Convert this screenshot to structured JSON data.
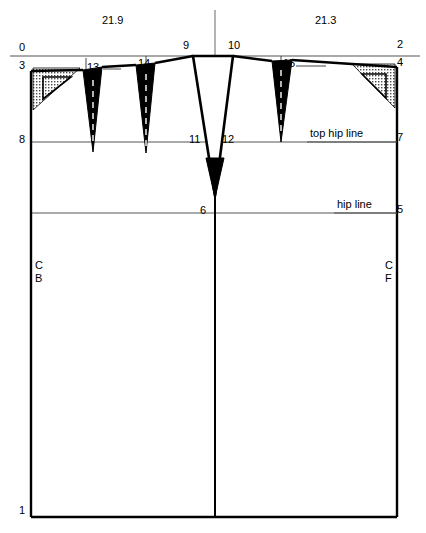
{
  "diagram": {
    "type": "pattern-drafting-diagram",
    "colors": {
      "ink": "#000000",
      "construction_line": "#555555",
      "dart_fill": "#000000",
      "stipple_fill": "#b8b8b8",
      "background": "#ffffff"
    },
    "dimension_labels": [
      {
        "id": "dim-left",
        "text": "21.9",
        "x": 117,
        "y": 21
      },
      {
        "id": "dim-right",
        "text": "21.3",
        "x": 330,
        "y": 21
      }
    ],
    "named_lines": [
      {
        "id": "top-hip-line",
        "text": "top hip line",
        "x": 357,
        "y": 134
      },
      {
        "id": "hip-line",
        "text": "hip line",
        "x": 364,
        "y": 205
      }
    ],
    "edge_labels": [
      {
        "id": "cb",
        "line1": "C",
        "line2": "B",
        "x": 38,
        "y": 263
      },
      {
        "id": "cf",
        "line1": "C",
        "line2": "F",
        "x": 388,
        "y": 263
      }
    ],
    "point_labels": [
      {
        "id": "point-0",
        "text": "0",
        "x": 22,
        "y": 47
      },
      {
        "id": "point-3",
        "text": "3",
        "x": 22,
        "y": 65
      },
      {
        "id": "point-8",
        "text": "8",
        "x": 22,
        "y": 138
      },
      {
        "id": "point-1",
        "text": "1",
        "x": 22,
        "y": 509
      },
      {
        "id": "point-9",
        "text": "9",
        "x": 186,
        "y": 45
      },
      {
        "id": "point-10",
        "text": "10",
        "x": 231,
        "y": 45
      },
      {
        "id": "point-11",
        "text": "11",
        "x": 193,
        "y": 138
      },
      {
        "id": "point-12",
        "text": "12",
        "x": 227,
        "y": 138
      },
      {
        "id": "point-6",
        "text": "6",
        "x": 203,
        "y": 208
      },
      {
        "id": "point-2",
        "text": "2",
        "x": 399,
        "y": 43
      },
      {
        "id": "point-4",
        "text": "4",
        "x": 399,
        "y": 61
      },
      {
        "id": "point-7",
        "text": "7",
        "x": 399,
        "y": 136
      },
      {
        "id": "point-5",
        "text": "5",
        "x": 399,
        "y": 207
      },
      {
        "id": "dart-13",
        "text": "13",
        "x": 91,
        "y": 66
      },
      {
        "id": "dart-14",
        "text": "14",
        "x": 140,
        "y": 62
      },
      {
        "id": "dart-15",
        "text": "15",
        "x": 287,
        "y": 62
      }
    ],
    "geometry": {
      "frame": {
        "left_x": 31,
        "right_x": 397,
        "center_x": 215,
        "bottom_y": 517,
        "waist_left_y": 71,
        "waist_right_y": 67
      },
      "reference_line": {
        "y": 56,
        "x1": 10,
        "x2": 420
      },
      "top_hip_line": {
        "y": 142,
        "x1": 31,
        "x2": 397
      },
      "hip_line": {
        "y": 213,
        "x1": 31,
        "x2": 397
      },
      "darts": [
        {
          "id": "dart-13",
          "apex_x": 93,
          "apex_y": 152,
          "left_x": 83,
          "left_y": 70,
          "right_x": 102,
          "right_y": 67
        },
        {
          "id": "dart-14",
          "apex_x": 146,
          "apex_y": 153,
          "left_x": 136,
          "left_y": 65,
          "right_x": 155,
          "right_y": 63
        },
        {
          "id": "dart-15",
          "apex_x": 281,
          "apex_y": 142,
          "left_x": 272,
          "left_y": 61,
          "right_x": 292,
          "right_y": 60
        },
        {
          "id": "dart-center",
          "apex_x": 215,
          "apex_y": 196,
          "left_x": 193,
          "left_y": 56,
          "right_x": 233,
          "right_y": 56
        }
      ]
    }
  }
}
